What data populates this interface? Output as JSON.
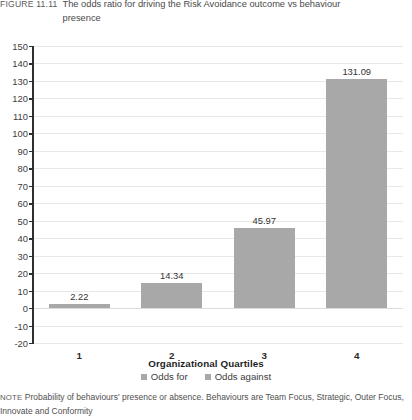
{
  "figure": {
    "label": "FIGURE 11.11",
    "caption": "The odds ratio for driving the Risk Avoidance outcome vs behaviour presence"
  },
  "note": {
    "label": "NOTE",
    "text": "Probability of behaviours' presence or absence. Behaviours are Team Focus, Strategic, Outer Focus, Innovate and Conformity"
  },
  "colors": {
    "bar": "#a8a8a8",
    "grid": "#e8e8e8",
    "axis": "#2f2f2f",
    "text": "#3b3b3b"
  },
  "chart_data": {
    "type": "bar",
    "title": "The odds ratio for driving the Risk Avoidance outcome vs behaviour presence",
    "xlabel": "Organizational Quartiles",
    "ylabel": "",
    "categories": [
      "1",
      "2",
      "3",
      "4"
    ],
    "values": [
      2.22,
      14.34,
      45.97,
      131.09
    ],
    "data_labels": [
      "2.22",
      "14.34",
      "45.97",
      "131.09"
    ],
    "ylim": [
      -20,
      150
    ],
    "ytick_step": 10,
    "yticks": [
      150,
      140,
      130,
      120,
      110,
      100,
      90,
      80,
      70,
      60,
      50,
      40,
      30,
      20,
      10,
      0,
      -10,
      -20
    ],
    "ytick_labels": [
      "150",
      "140",
      "130",
      "120",
      "110",
      "100",
      "90",
      "80",
      "70",
      "60",
      "50",
      "40",
      "30",
      "20",
      "10",
      "0",
      "-10",
      "-20"
    ],
    "grid": true,
    "legend_position": "bottom",
    "legend": [
      {
        "name": "Odds for",
        "color": "#a8a8a8"
      },
      {
        "name": "Odds against",
        "color": "#a8a8a8"
      }
    ],
    "series": [
      {
        "name": "Odds for",
        "values": [
          2.22,
          14.34,
          45.97,
          131.09
        ]
      }
    ]
  }
}
